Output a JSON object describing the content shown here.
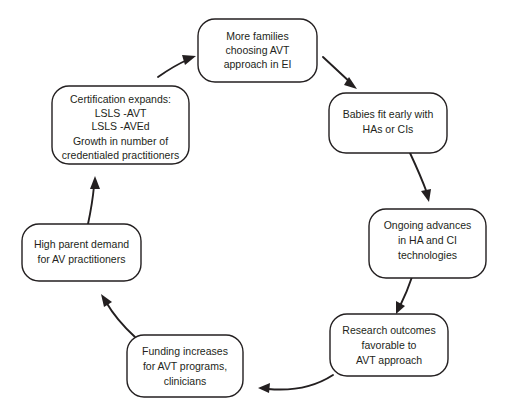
{
  "diagram": {
    "type": "cycle-flowchart",
    "title": "",
    "background_color": "#ffffff",
    "stroke_color": "#231f20",
    "text_color": "#231f20",
    "nodes": [
      {
        "id": "more-families",
        "position": "top",
        "lines": [
          "More families",
          "choosing AVT",
          "approach in EI"
        ]
      },
      {
        "id": "babies-fit",
        "position": "top-right",
        "lines": [
          "Babies fit early with",
          "HAs or CIs"
        ]
      },
      {
        "id": "ongoing-advances",
        "position": "right",
        "lines": [
          "Ongoing advances",
          "in HA and CI",
          "technologies"
        ]
      },
      {
        "id": "research-outcomes",
        "position": "bottom-right",
        "lines": [
          "Research outcomes",
          "favorable to",
          "AVT approach"
        ]
      },
      {
        "id": "funding-increases",
        "position": "bottom",
        "lines": [
          "Funding increases",
          "for AVT programs,",
          "clinicians"
        ]
      },
      {
        "id": "high-parent-demand",
        "position": "left",
        "lines": [
          "High parent demand",
          "for AV practitioners"
        ]
      },
      {
        "id": "certification-expands",
        "position": "top-left",
        "lines": [
          "Certification expands:",
          "LSLS -AVT",
          "LSLS -AVEd",
          "",
          "Growth in number of",
          "credentialed practitioners"
        ]
      }
    ],
    "arrows": [
      {
        "id": "arrow-more-families-to-babies",
        "from": "more-families",
        "to": "babies-fit",
        "shape": "straight",
        "direction": "down-right"
      },
      {
        "id": "arrow-babies-to-ongoing",
        "from": "babies-fit",
        "to": "ongoing-advances",
        "shape": "curved",
        "direction": "down"
      },
      {
        "id": "arrow-ongoing-to-research",
        "from": "ongoing-advances",
        "to": "research-outcomes",
        "shape": "curved",
        "direction": "down"
      },
      {
        "id": "arrow-research-to-funding",
        "from": "research-outcomes",
        "to": "funding-increases",
        "shape": "curved",
        "direction": "left"
      },
      {
        "id": "arrow-funding-to-demand",
        "from": "funding-increases",
        "to": "high-parent-demand",
        "shape": "curved",
        "direction": "up-left"
      },
      {
        "id": "arrow-demand-to-certification",
        "from": "high-parent-demand",
        "to": "certification-expands",
        "shape": "curved",
        "direction": "up"
      },
      {
        "id": "arrow-certification-to-more-families",
        "from": "certification-expands",
        "to": "more-families",
        "shape": "curved",
        "direction": "up-right"
      }
    ]
  }
}
